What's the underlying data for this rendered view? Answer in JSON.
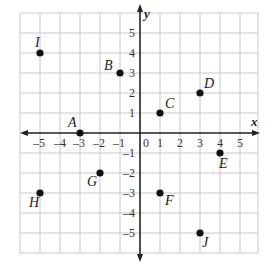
{
  "diagram": {
    "type": "coordinate-plane",
    "x_axis_label": "x",
    "y_axis_label": "y",
    "x_range": [
      -6,
      6
    ],
    "y_range": [
      -6,
      6
    ],
    "x_ticks": [
      "-5",
      "-4",
      "-3",
      "-2",
      "-1",
      "0",
      "1",
      "2",
      "3",
      "4",
      "5"
    ],
    "y_ticks": [
      "5",
      "4",
      "3",
      "2",
      "1",
      "-1",
      "-2",
      "-3",
      "-4",
      "-5"
    ],
    "origin_label": "0",
    "points": [
      {
        "label": "A",
        "x": -3,
        "y": 0
      },
      {
        "label": "B",
        "x": -1,
        "y": 3
      },
      {
        "label": "C",
        "x": 1,
        "y": 1
      },
      {
        "label": "D",
        "x": 3,
        "y": 2
      },
      {
        "label": "E",
        "x": 4,
        "y": -1
      },
      {
        "label": "F",
        "x": 1,
        "y": -3
      },
      {
        "label": "G",
        "x": -2,
        "y": -2
      },
      {
        "label": "H",
        "x": -5,
        "y": -3
      },
      {
        "label": "I",
        "x": -5,
        "y": 4
      },
      {
        "label": "J",
        "x": 3,
        "y": -5
      }
    ]
  }
}
